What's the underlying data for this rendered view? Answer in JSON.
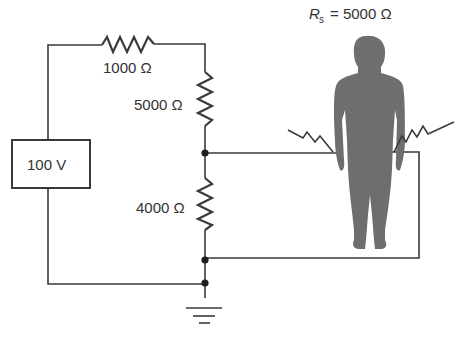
{
  "title": {
    "symbol": "R",
    "subscript": "s",
    "equals": "= 5000 Ω"
  },
  "source": {
    "label": "100 V"
  },
  "resistors": [
    {
      "id": "r1",
      "label": "1000 Ω",
      "orientation": "horizontal"
    },
    {
      "id": "r2",
      "label": "5000 Ω",
      "orientation": "vertical"
    },
    {
      "id": "r3",
      "label": "4000 Ω",
      "orientation": "vertical"
    }
  ],
  "person": {
    "description": "human body silhouette connected across the 4000 Ω resistor",
    "resistance_label": "R_s = 5000 Ω"
  },
  "colors": {
    "wire": "#3a3a3a",
    "silhouette": "#6e6e6e",
    "background": "#ffffff"
  }
}
